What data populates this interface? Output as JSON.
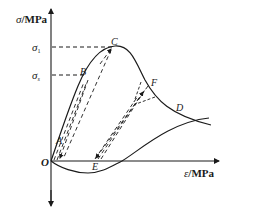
{
  "figure": {
    "type": "stress-strain curve diagram",
    "y_axis": {
      "label_symbol": "σ",
      "label_unit": "/MPa"
    },
    "x_axis": {
      "label_symbol": "ε",
      "label_unit": "/MPa"
    },
    "origin_label": "O",
    "levels": [
      {
        "symbol": "σ",
        "subscript": "1"
      },
      {
        "symbol": "σ",
        "subscript": "s"
      }
    ],
    "points": {
      "A": "A",
      "B": "B",
      "C": "C",
      "D": "D",
      "E": "E",
      "F": "F"
    },
    "colors": {
      "line": "#1a1a1a",
      "background": "#ffffff"
    }
  }
}
